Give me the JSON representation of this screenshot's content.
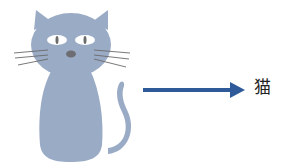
{
  "diagram": {
    "image": {
      "subject": "cat",
      "icon": "cat-illustration-icon",
      "color": "#9aabc6"
    },
    "arrow": {
      "color": "#2f5a99"
    },
    "label": "猫"
  }
}
